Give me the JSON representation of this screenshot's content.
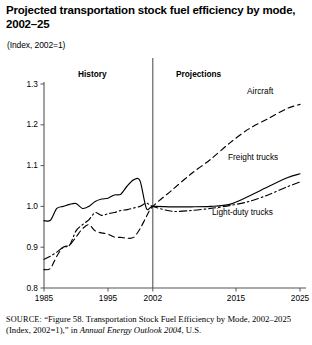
{
  "title": "Projected transportation stock fuel efficiency by mode, 2002–25",
  "subtitle": "(Index, 2002 1)",
  "subtitle_display": "(Index, 2002=1)",
  "periods": {
    "history_label": "History",
    "projections_label": "Projections",
    "divider_year": 2002
  },
  "series_labels": {
    "aircraft": "Aircraft",
    "freight_trucks": "Freight trucks",
    "light_duty_trucks": "Light-duty trucks"
  },
  "source": {
    "prefix": "SOURCE:",
    "text_part1": " “Figure 58. Transportation Stock Fuel Efficiency by Mode, 2002–2025 (Index, 2002=1),” in ",
    "italic_part": "Annual Energy Outlook 2004",
    "text_part2": ", U.S."
  },
  "chart_data": {
    "type": "line",
    "title": "Projected transportation stock fuel efficiency by mode, 2002–25",
    "subtitle": "(Index, 2002=1)",
    "xlabel": "",
    "ylabel": "Index, 2002=1",
    "xlim": [
      1985,
      2025
    ],
    "ylim": [
      0.8,
      1.3
    ],
    "yticks": [
      "0.8",
      "0.9",
      "1.0",
      "1.1",
      "1.2",
      "1.3"
    ],
    "ytick_values": [
      0.8,
      0.9,
      1.0,
      1.1,
      1.2,
      1.3
    ],
    "xticks": [
      "1985",
      "1995",
      "2002",
      "2015",
      "2025"
    ],
    "xtick_values": [
      1985,
      1995,
      2002,
      2015,
      2025
    ],
    "grid": false,
    "legend": "inline-annotations",
    "divider_x": 2002,
    "divider_note": "vertical rule separating History (left) from Projections (right)",
    "series": [
      {
        "name": "Aircraft",
        "style": "dashed",
        "color": "#000000",
        "x": [
          1985,
          1986,
          1987,
          1988,
          1989,
          1990,
          1991,
          1992,
          1993,
          1994,
          1995,
          1996,
          1997,
          1998,
          1999,
          2000,
          2001,
          2002,
          2005,
          2008,
          2011,
          2014,
          2017,
          2020,
          2023,
          2025
        ],
        "values": [
          0.845,
          0.848,
          0.878,
          0.9,
          0.905,
          0.925,
          0.945,
          0.955,
          0.94,
          0.935,
          0.932,
          0.925,
          0.924,
          0.922,
          0.924,
          0.945,
          0.975,
          1.0,
          1.04,
          1.08,
          1.115,
          1.155,
          1.19,
          1.215,
          1.24,
          1.25
        ]
      },
      {
        "name": "Freight trucks",
        "style": "solid",
        "color": "#000000",
        "x": [
          1985,
          1986,
          1987,
          1988,
          1989,
          1990,
          1991,
          1992,
          1993,
          1994,
          1995,
          1996,
          1997,
          1998,
          1999,
          2000,
          2001,
          2002,
          2005,
          2008,
          2011,
          2014,
          2017,
          2020,
          2023,
          2025
        ],
        "values": [
          0.965,
          0.966,
          0.995,
          1.0,
          1.005,
          1.007,
          0.995,
          1.0,
          1.012,
          1.018,
          1.02,
          1.028,
          1.03,
          1.05,
          1.065,
          1.063,
          0.995,
          1.0,
          0.999,
          0.999,
          1.0,
          1.005,
          1.025,
          1.048,
          1.07,
          1.08
        ]
      },
      {
        "name": "Light-duty trucks",
        "style": "dash-dot",
        "color": "#000000",
        "x": [
          1985,
          1986,
          1987,
          1988,
          1989,
          1990,
          1991,
          1992,
          1993,
          1994,
          1995,
          1996,
          1997,
          1998,
          1999,
          2000,
          2001,
          2002,
          2005,
          2008,
          2011,
          2014,
          2017,
          2020,
          2023,
          2025
        ],
        "values": [
          0.87,
          0.878,
          0.888,
          0.9,
          0.905,
          0.94,
          0.955,
          0.967,
          0.985,
          0.978,
          0.982,
          0.985,
          0.99,
          0.992,
          0.996,
          1.0,
          1.008,
          1.0,
          0.988,
          0.99,
          0.995,
          1.002,
          1.012,
          1.028,
          1.048,
          1.06
        ]
      }
    ]
  },
  "geometry": {
    "plot_left": 44,
    "plot_right": 300,
    "plot_top": 26,
    "plot_bottom": 230
  }
}
